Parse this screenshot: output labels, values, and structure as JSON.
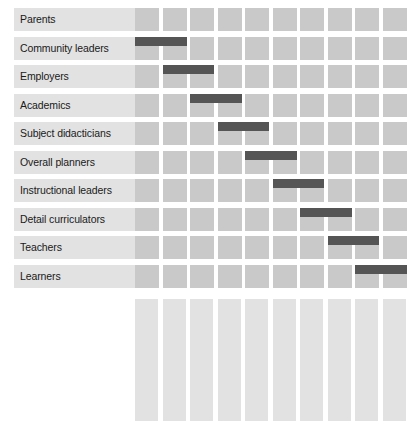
{
  "chart_data": {
    "type": "heatmap",
    "title": "",
    "subtitle": "",
    "xlabel": "",
    "ylabel": "",
    "grid": true,
    "legend_position": "none",
    "categories": [
      "Parents",
      "Community leaders",
      "Employers",
      "Academics",
      "Subject didacticians",
      "Overall planners",
      "Instructional leaders",
      "Detail curriculators",
      "Teachers",
      "Learners"
    ],
    "row_labels": [
      "Parents",
      "Community leaders",
      "Employers",
      "Academics",
      "Subject didacticians",
      "Overall planners",
      "Instructional leaders",
      "Detail curriculators",
      "Teachers",
      "Learners"
    ],
    "column_labels": [
      "Parents",
      "Community leaders",
      "Employers",
      "Academics",
      "Subject didacticians",
      "Overall planners",
      "Instructional leaders",
      "Detail curriculators",
      "Teachers",
      "Learners"
    ],
    "bars": [
      {
        "row": "Parents",
        "row_index": 0,
        "start_column_index": null,
        "end_column_index": null,
        "span": 0
      },
      {
        "row": "Community leaders",
        "row_index": 1,
        "start_column_index": 0,
        "end_column_index": 1,
        "span": 2
      },
      {
        "row": "Employers",
        "row_index": 2,
        "start_column_index": 1,
        "end_column_index": 2,
        "span": 2
      },
      {
        "row": "Academics",
        "row_index": 3,
        "start_column_index": 2,
        "end_column_index": 3,
        "span": 2
      },
      {
        "row": "Subject didacticians",
        "row_index": 4,
        "start_column_index": 3,
        "end_column_index": 4,
        "span": 2
      },
      {
        "row": "Overall planners",
        "row_index": 5,
        "start_column_index": 4,
        "end_column_index": 5,
        "span": 2
      },
      {
        "row": "Instructional leaders",
        "row_index": 6,
        "start_column_index": 5,
        "end_column_index": 6,
        "span": 2
      },
      {
        "row": "Detail curriculators",
        "row_index": 7,
        "start_column_index": 6,
        "end_column_index": 7,
        "span": 2
      },
      {
        "row": "Teachers",
        "row_index": 8,
        "start_column_index": 7,
        "end_column_index": 8,
        "span": 2
      },
      {
        "row": "Learners",
        "row_index": 9,
        "start_column_index": 8,
        "end_column_index": 9,
        "span": 2
      }
    ],
    "colors": {
      "bar": "#555555",
      "cell": "#c9c9c9",
      "label_strip": "#e2e2e2",
      "gridline": "#ffffff",
      "text": "#1a1a1a",
      "background": "#ffffff"
    }
  }
}
